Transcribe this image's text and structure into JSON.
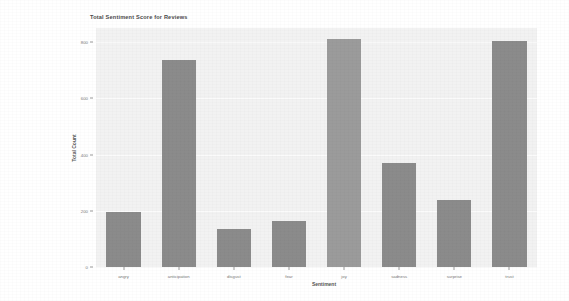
{
  "chart_data": {
    "type": "bar",
    "title": "Total Sentiment Score for Reviews",
    "xlabel": "Sentiment",
    "ylabel": "Total Count",
    "categories": [
      "angry",
      "anticipation",
      "disgust",
      "fear",
      "joy",
      "sadness",
      "surprise",
      "trust"
    ],
    "values": [
      195,
      735,
      135,
      165,
      810,
      370,
      240,
      805
    ],
    "ylim": [
      0,
      850
    ],
    "yticks": [
      0,
      200,
      400,
      600,
      800
    ],
    "ytick_labels": [
      "0",
      "200",
      "400",
      "600",
      "800"
    ],
    "grid": true,
    "legend": null,
    "bar_colors": [
      "#8b8b8b",
      "#8b8b8b",
      "#8b8b8b",
      "#8b8b8b",
      "#9b9b9b",
      "#8b8b8b",
      "#8b8b8b",
      "#8b8b8b"
    ],
    "plot_background": "#f2f2f2",
    "figure_background": "#ffffff",
    "gridline_color": "#fbfbfb"
  }
}
